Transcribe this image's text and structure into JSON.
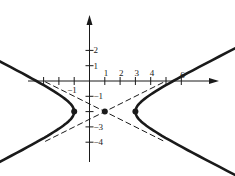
{
  "diagram": {
    "type": "hyperbola-graph",
    "equation_parameters": {
      "center": [
        1,
        -2
      ],
      "a": 2,
      "b": 1,
      "orientation": "horizontal"
    },
    "pixel_mapping": {
      "origin_px": [
        89.5,
        81
      ],
      "unit_px": 15.3
    },
    "axes": {
      "x_range": [
        -4,
        8.3
      ],
      "y_range": [
        -5.3,
        4.3
      ],
      "x_tick_values": [
        -3,
        -2,
        -1,
        1,
        2,
        3,
        4,
        5,
        6
      ],
      "y_tick_values": [
        2,
        1,
        -1,
        -2,
        -3,
        -4
      ],
      "x_labels": [
        {
          "value": 1,
          "text": "1"
        },
        {
          "value": 2,
          "text": "2"
        },
        {
          "value": 3,
          "text": "3"
        },
        {
          "value": 4,
          "text": "4"
        },
        {
          "value": 6,
          "text": "6"
        },
        {
          "value": -1,
          "text": "−1"
        }
      ],
      "y_labels": [
        {
          "value": 2,
          "text": "2"
        },
        {
          "value": 1,
          "text": "1"
        },
        {
          "value": -1,
          "text": "−1"
        },
        {
          "value": -3,
          "text": "−3"
        },
        {
          "value": -4,
          "text": "−4"
        }
      ]
    },
    "points": [
      {
        "name": "center",
        "coords": [
          1,
          -2
        ]
      },
      {
        "name": "left-vertex",
        "coords": [
          -1,
          -2
        ]
      },
      {
        "name": "right-vertex",
        "coords": [
          3,
          -2
        ]
      }
    ],
    "asymptotes": {
      "style": "dashed",
      "slopes": [
        0.5,
        -0.5
      ],
      "t_extent": 3.9
    },
    "curve": {
      "t_max": 2.75,
      "color": "#1a1a1a"
    },
    "colors": {
      "ink": "#1a1a1a",
      "background": "#ffffff"
    }
  }
}
